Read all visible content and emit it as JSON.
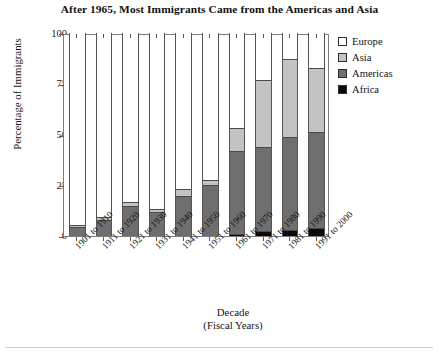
{
  "chart_data": {
    "type": "bar",
    "subtype": "stacked-bar-100-percent-partial",
    "title": "After 1965, Most Immigrants Came from the Americas and Asia",
    "xlabel": "Decade",
    "xlabel_sub": "(Fiscal Years)",
    "ylabel": "Percentage of Immigrants",
    "ylim": [
      0,
      100
    ],
    "yticks": [
      0,
      25,
      50,
      75,
      100
    ],
    "ytick_labels": [
      "0",
      "25",
      "50",
      "75",
      "100"
    ],
    "grid": false,
    "legend_position": "right-top",
    "stack_order_bottom_to_top": [
      "Africa",
      "Americas",
      "Asia",
      "Europe"
    ],
    "categories": [
      "1901 to 1910",
      "1911 to 1920",
      "1921 to 1930",
      "1931 to 1940",
      "1941 to 1950",
      "1951 to 1960",
      "1961 to 1970",
      "1971 to 1980",
      "1981 to 1990",
      "1991 to 2000"
    ],
    "series": [
      {
        "name": "Africa",
        "color": "#0a0a0a",
        "values": [
          0,
          0,
          0,
          0,
          0,
          0,
          1,
          2.5,
          3,
          4
        ]
      },
      {
        "name": "Americas",
        "color": "#6e6e6e",
        "values": [
          4.5,
          8,
          15,
          12,
          19.5,
          25,
          41,
          41.5,
          46,
          47
        ]
      },
      {
        "name": "Asia",
        "color": "#c3c3c3",
        "values": [
          1,
          1.5,
          2,
          1.5,
          3.5,
          2.5,
          11,
          33,
          38,
          32
        ]
      },
      {
        "name": "Europe",
        "color": "#ffffff",
        "values": [
          94.5,
          90.5,
          83,
          86.5,
          77,
          72.5,
          47,
          23,
          13,
          17
        ]
      }
    ],
    "cumulative_tops": {
      "africa": [
        0,
        0,
        0,
        0,
        0,
        0,
        1,
        2.5,
        3,
        4
      ],
      "americas": [
        4.5,
        8,
        15,
        12,
        19.5,
        25,
        42,
        44,
        49,
        51
      ],
      "asia": [
        5.5,
        9.5,
        17,
        13.5,
        23,
        27.5,
        53,
        77,
        87,
        83
      ],
      "europe": [
        100,
        100,
        100,
        100,
        100,
        100,
        100,
        100,
        100,
        100
      ]
    },
    "note": "Bars are drawn only up to the Asia top; the remainder to 100 is the open white Europe region."
  },
  "legend": {
    "items": [
      {
        "label": "Europe",
        "color": "#ffffff"
      },
      {
        "label": "Asia",
        "color": "#c3c3c3"
      },
      {
        "label": "Americas",
        "color": "#6e6e6e"
      },
      {
        "label": "Africa",
        "color": "#0a0a0a"
      }
    ]
  }
}
